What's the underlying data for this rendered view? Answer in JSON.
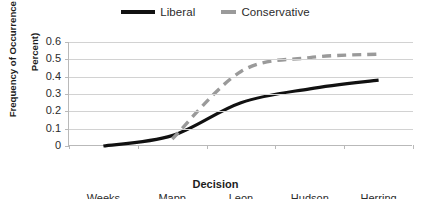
{
  "chart_data": {
    "type": "line",
    "title": "",
    "xlabel": "Decision",
    "ylabel": "Frequency of Occurrence (in Percent)",
    "ylabel_line1": "Frequency of Occurrence (in",
    "ylabel_line2": "Percent)",
    "categories": [
      "Weeks",
      "Mapp",
      "Leon",
      "Hudson",
      "Herring"
    ],
    "ylim": [
      0,
      0.6
    ],
    "ytick_labels": [
      "0.6",
      "0.5",
      "0.4",
      "0.3",
      "0.2",
      "0.1",
      "0"
    ],
    "ytick_values": [
      0.6,
      0.5,
      0.4,
      0.3,
      0.2,
      0.1,
      0
    ],
    "grid": true,
    "legend_position": "top",
    "series": [
      {
        "name": "Liberal",
        "color": "#111111",
        "style": "solid",
        "values": [
          0.0,
          0.06,
          0.25,
          0.33,
          0.38
        ]
      },
      {
        "name": "Conservative",
        "color": "#9a9a9a",
        "style": "dashed",
        "values": [
          null,
          0.04,
          0.43,
          0.51,
          0.53
        ]
      }
    ]
  },
  "legend": {
    "liberal_label": "Liberal",
    "conservative_label": "Conservative"
  },
  "axes": {
    "y_title_line1": "Frequency of Occurrence (in",
    "y_title_line2": "Percent)",
    "x_title": "Decision",
    "y_ticks": [
      "0.6",
      "0.5",
      "0.4",
      "0.3",
      "0.2",
      "0.1",
      "0"
    ],
    "x_ticks": [
      "Weeks",
      "Mapp",
      "Leon",
      "Hudson",
      "Herring"
    ]
  },
  "colors": {
    "liberal": "#111111",
    "conservative": "#9a9a9a",
    "gridline": "#d2d2d2",
    "axis": "#b9b9b9",
    "background": "#ffffff"
  }
}
